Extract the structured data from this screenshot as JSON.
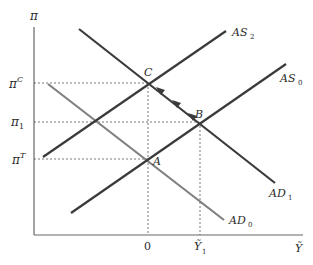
{
  "diagram": {
    "type": "AS-AD economic diagram",
    "axes": {
      "y_label": "π",
      "x_label": "Ỹ",
      "x_ticks": [
        {
          "label": "0",
          "x": 148
        },
        {
          "label": "Ỹ",
          "sub": "1",
          "x": 200
        }
      ],
      "y_ticks": [
        {
          "label": "π",
          "sup": "C",
          "y": 83
        },
        {
          "label": "π",
          "sub": "1",
          "y": 122
        },
        {
          "label": "π",
          "sup": "T",
          "y": 159
        }
      ]
    },
    "curves": [
      {
        "name": "AS_2",
        "label": "AS",
        "sub": "2",
        "color": "#3a3a3a",
        "x1": 43,
        "y1": 157,
        "x2": 226,
        "y2": 31
      },
      {
        "name": "AS_0",
        "label": "AS",
        "sub": "0",
        "color": "#3a3a3a",
        "x1": 71,
        "y1": 213,
        "x2": 286,
        "y2": 64
      },
      {
        "name": "AD_1",
        "label": "AD",
        "sub": "1",
        "color": "#3a3a3a",
        "x1": 79,
        "y1": 29,
        "x2": 275,
        "y2": 183
      },
      {
        "name": "AD_0",
        "label": "AD",
        "sub": "0",
        "color": "#808080",
        "x1": 48,
        "y1": 84,
        "x2": 224,
        "y2": 220
      }
    ],
    "points": [
      {
        "name": "A",
        "label": "A",
        "x": 148,
        "y": 160
      },
      {
        "name": "B",
        "label": "B",
        "x": 199,
        "y": 121
      },
      {
        "name": "C",
        "label": "C",
        "x": 149,
        "y": 83
      }
    ],
    "path_arrows": {
      "from": "B",
      "to": "C",
      "count": 3
    }
  }
}
